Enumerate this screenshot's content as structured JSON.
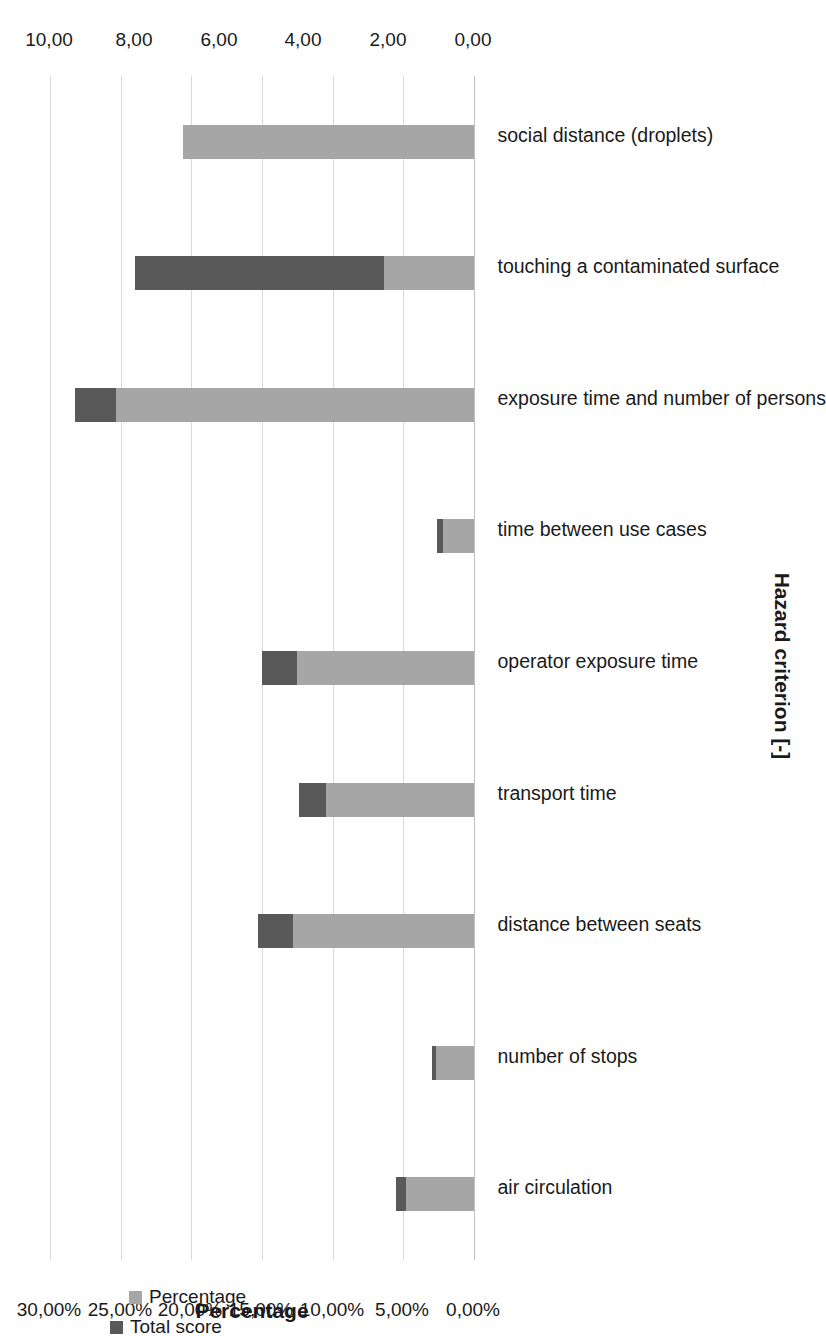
{
  "chart_data": {
    "type": "bar",
    "subtype": "stacked-vertical-rotated",
    "title": "",
    "orientation": "image rotated 90 degrees counter-clockwise",
    "categories": [
      "air circulation",
      "number of stops",
      "distance between seats",
      "transport time",
      "operator exposure time",
      "time between use cases",
      "exposure time and number of persons",
      "touching a contaminated surface",
      "social distance (droplets)"
    ],
    "series": [
      {
        "name": "Percentage",
        "color": "#a6a6a6",
        "axis": "primary",
        "unit": "%",
        "values": [
          4.8,
          2.7,
          12.8,
          10.5,
          12.5,
          2.2,
          25.3,
          6.4,
          20.6
        ]
      },
      {
        "name": "Total score",
        "color": "#595959",
        "axis": "secondary",
        "unit": "-",
        "values": [
          0.7,
          0.3,
          2.5,
          1.9,
          2.5,
          0.4,
          2.9,
          1.0,
          3.4
        ]
      }
    ],
    "stack_totals_percent": [
      5.5,
      3.0,
      15.3,
      12.4,
      15.0,
      2.6,
      28.2,
      24.0,
      7.4
    ],
    "primary_axis": {
      "label": "Percentage",
      "ticks": [
        "0,00%",
        "5,00%",
        "10,00%",
        "15,00%",
        "20,00%",
        "25,00%",
        "30,00%"
      ],
      "tick_values": [
        0,
        5,
        10,
        15,
        20,
        25,
        30
      ],
      "lim": [
        0,
        30
      ]
    },
    "secondary_axis": {
      "label": "Total score [-]",
      "ticks": [
        "0,00",
        "2,00",
        "4,00",
        "6,00",
        "8,00",
        "10,00"
      ],
      "tick_values": [
        0,
        2,
        4,
        6,
        8,
        10
      ],
      "lim": [
        0,
        10
      ]
    },
    "category_axis": {
      "label": "Hazard criterion [-]"
    },
    "legend": {
      "position": "top-left",
      "entries": [
        {
          "label": "Total score",
          "color": "#595959"
        },
        {
          "label": "Percentage",
          "color": "#a6a6a6"
        }
      ]
    },
    "grid": {
      "horizontal": true,
      "vertical": false,
      "color": "#d9d9d9"
    }
  },
  "colors": {
    "dark": "#595959",
    "light": "#a6a6a6",
    "grid": "#d9d9d9",
    "axis": "#bfbfbf",
    "text": "#1a1a1a",
    "background": "#ffffff"
  }
}
